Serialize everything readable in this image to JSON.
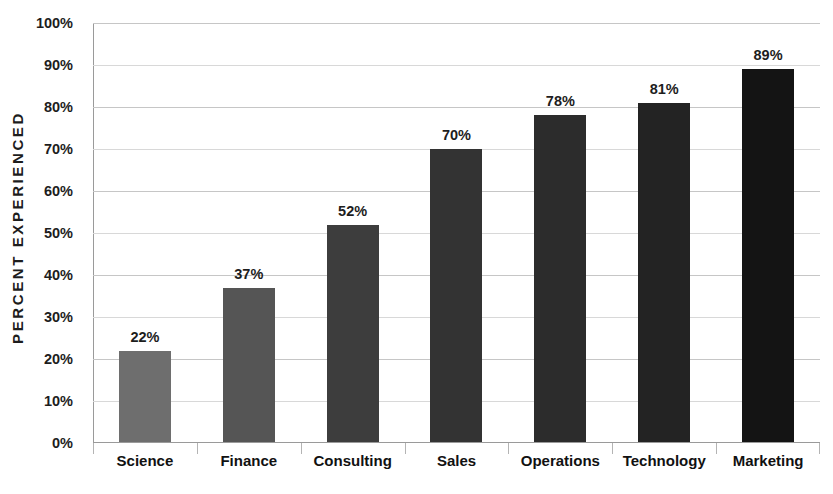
{
  "chart_data": {
    "type": "bar",
    "title": "",
    "xlabel": "",
    "ylabel": "PERCENT EXPERIENCED",
    "categories": [
      "Science",
      "Finance",
      "Consulting",
      "Sales",
      "Operations",
      "Technology",
      "Marketing"
    ],
    "values": [
      22,
      37,
      52,
      70,
      78,
      81,
      89
    ],
    "value_labels": [
      "22%",
      "37%",
      "52%",
      "70%",
      "78%",
      "81%",
      "89%"
    ],
    "ylim": [
      0,
      100
    ],
    "ytick_values": [
      0,
      10,
      20,
      30,
      40,
      50,
      60,
      70,
      80,
      90,
      100
    ],
    "ytick_labels": [
      "0%",
      "10%",
      "20%",
      "30%",
      "40%",
      "50%",
      "60%",
      "70%",
      "80%",
      "90%",
      "100%"
    ],
    "grid": true,
    "legend": "none",
    "bar_colors": [
      "#6e6e6e",
      "#555555",
      "#3d3d3d",
      "#333333",
      "#2c2c2c",
      "#232323",
      "#141414"
    ],
    "colors": {
      "background": "#ffffff",
      "gridline": "#c6c6c6",
      "axis": "#9a9a9a",
      "text": "#1d1d1d"
    }
  }
}
